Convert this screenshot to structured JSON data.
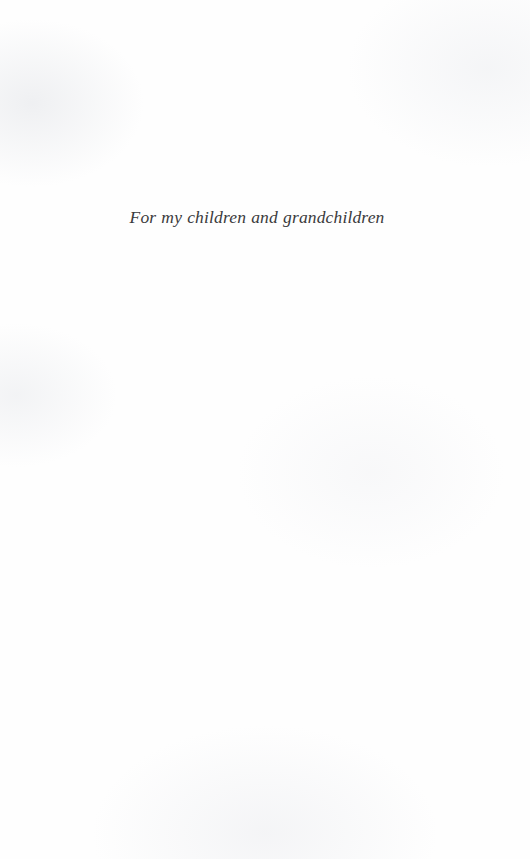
{
  "document": {
    "type": "book-dedication-page",
    "page_background_color": "#fefefe",
    "ink_color": "#3a3a3c"
  },
  "dedication": {
    "text": "For my children and grandchildren"
  }
}
